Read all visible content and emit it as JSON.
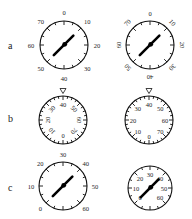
{
  "figure": {
    "rows": [
      {
        "label": "a",
        "label_pos": [
          8,
          41
        ],
        "dials": [
          {
            "name": "dial-a-left",
            "cx": 64,
            "cy": 45,
            "r": 24,
            "ticks": 16,
            "labels": [
              "0",
              "10",
              "20",
              "30",
              "40",
              "50",
              "60",
              "70"
            ],
            "label_offset": 9,
            "label_orientation": "upright",
            "marker": "none",
            "needle_angle": 45
          },
          {
            "name": "dial-a-right",
            "cx": 150,
            "cy": 45,
            "r": 24,
            "ticks": 16,
            "labels": [
              "0",
              "10",
              "20",
              "30",
              "40",
              "50",
              "60",
              "70"
            ],
            "label_offset": 8,
            "label_orientation": "radial",
            "marker": "none",
            "needle_angle": 45
          }
        ]
      },
      {
        "label": "b",
        "label_pos": [
          8,
          114
        ],
        "dials": [
          {
            "name": "dial-b-left",
            "cx": 63,
            "cy": 120,
            "r": 24,
            "ticks": 32,
            "labels": [
              "40",
              "50",
              "60",
              "70",
              "0",
              "10",
              "20",
              "30"
            ],
            "label_offset": -8,
            "label_orientation": "radial",
            "marker": "triangle-top",
            "needle_angle": null
          },
          {
            "name": "dial-b-right",
            "cx": 149,
            "cy": 120,
            "r": 24,
            "ticks": 32,
            "labels": [
              "40",
              "50",
              "60",
              "70",
              "0",
              "10",
              "20",
              "30"
            ],
            "label_offset": -8,
            "label_orientation": "upright",
            "marker": "triangle-top",
            "needle_angle": null
          }
        ]
      },
      {
        "label": "c",
        "label_pos": [
          8,
          183
        ],
        "dials": [
          {
            "name": "dial-c-left",
            "cx": 63,
            "cy": 186,
            "r": 24,
            "ticks": 16,
            "labels": [
              "0",
              "10",
              "20",
              "30",
              "40",
              "50",
              "60"
            ],
            "label_angles": [
              -135,
              -90,
              -45,
              0,
              45,
              90,
              135
            ],
            "label_offset": 8,
            "label_orientation": "upright",
            "marker": "none",
            "needle_angle": 45
          },
          {
            "name": "dial-c-right",
            "cx": 150,
            "cy": 188,
            "r": 22,
            "ticks": 16,
            "labels": [
              "0",
              "10",
              "20",
              "30",
              "40",
              "50",
              "60"
            ],
            "label_angles": [
              -135,
              -90,
              -45,
              0,
              45,
              90,
              135
            ],
            "label_offset": -8,
            "label_orientation": "upright",
            "marker": "none",
            "needle_angle": 45
          }
        ]
      }
    ]
  }
}
